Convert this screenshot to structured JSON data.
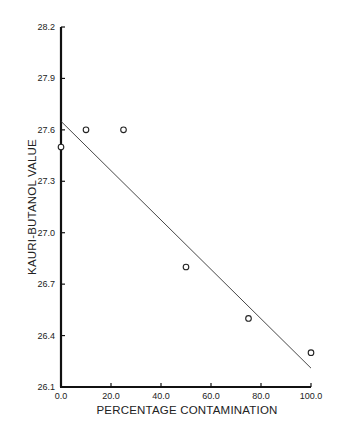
{
  "chart_data": {
    "type": "scatter",
    "title": "",
    "xlabel": "PERCENTAGE CONTAMINATION",
    "ylabel": "KAURI-BUTANOL VALUE",
    "xlim": [
      0,
      100
    ],
    "ylim": [
      26.1,
      28.2
    ],
    "x_ticks": [
      0,
      20,
      40,
      60,
      80,
      100
    ],
    "x_tick_labels": [
      "0.0",
      "20.0",
      "40.0",
      "60.0",
      "80.0",
      "100.0"
    ],
    "y_ticks": [
      26.1,
      26.4,
      26.7,
      27.0,
      27.3,
      27.6,
      27.9,
      28.2
    ],
    "y_tick_labels": [
      "26.1",
      "26.4",
      "26.7",
      "27.0",
      "27.3",
      "27.6",
      "27.9",
      "28.2"
    ],
    "grid": false,
    "legend": null,
    "series": [
      {
        "name": "observed",
        "marker": "open-circle",
        "x": [
          0,
          10,
          25,
          50,
          75,
          100
        ],
        "y": [
          27.5,
          27.6,
          27.6,
          26.8,
          26.5,
          26.3
        ]
      },
      {
        "name": "fitted line",
        "type": "line",
        "x": [
          0,
          100
        ],
        "y": [
          27.65,
          26.21
        ]
      }
    ]
  }
}
